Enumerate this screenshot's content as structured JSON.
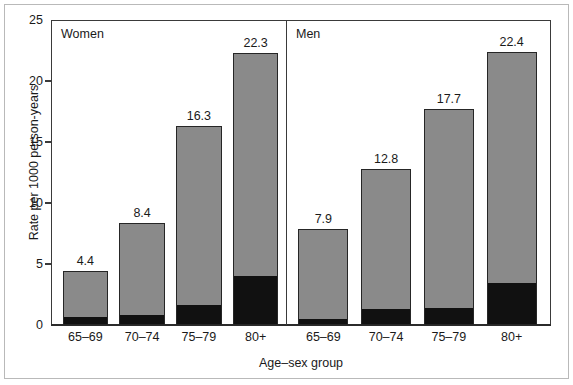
{
  "chart_data": {
    "type": "bar",
    "title": "",
    "xlabel": "Age–sex group",
    "ylabel": "Rate per 1000 person-years",
    "ylim": [
      0,
      25
    ],
    "yticks": [
      0,
      5,
      10,
      15,
      20,
      25
    ],
    "ytick_labels": [
      "0",
      "5",
      "10",
      "15",
      "20",
      "25"
    ],
    "grid": false,
    "legend": "none",
    "stacked": true,
    "categories": [
      "65–69",
      "70–74",
      "75–79",
      "80+"
    ],
    "panels": [
      {
        "label": "Women",
        "categories": [
          "65–69",
          "70–74",
          "75–79",
          "80+"
        ],
        "totals": [
          4.4,
          8.4,
          16.3,
          22.3
        ],
        "total_labels": [
          "4.4",
          "8.4",
          "16.3",
          "22.3"
        ],
        "series": [
          {
            "name": "lower-segment",
            "color": "#111111",
            "values": [
              0.55,
              0.75,
              1.55,
              3.95
            ]
          },
          {
            "name": "upper-segment",
            "color": "#8a8a8a",
            "values": [
              3.85,
              7.65,
              14.75,
              18.35
            ]
          }
        ]
      },
      {
        "label": "Men",
        "categories": [
          "65–69",
          "70–74",
          "75–79",
          "80+"
        ],
        "totals": [
          7.9,
          12.8,
          17.7,
          22.4
        ],
        "total_labels": [
          "7.9",
          "12.8",
          "17.7",
          "22.4"
        ],
        "series": [
          {
            "name": "lower-segment",
            "color": "#111111",
            "values": [
              0.4,
              1.2,
              1.35,
              3.4
            ]
          },
          {
            "name": "upper-segment",
            "color": "#8a8a8a",
            "values": [
              7.5,
              11.6,
              16.35,
              19.0
            ]
          }
        ]
      }
    ],
    "colors": {
      "bar_upper": "#8a8a8a",
      "bar_lower": "#111111",
      "bar_outline": "#262626",
      "axis": "#3a3a3a",
      "frame": "#b9b9b9",
      "text": "#1a1a1a",
      "background": "#ffffff"
    }
  }
}
